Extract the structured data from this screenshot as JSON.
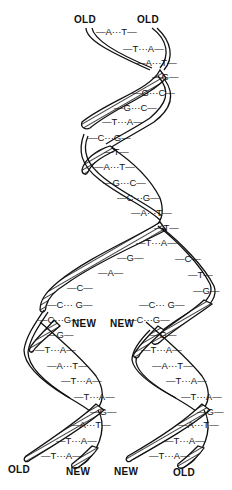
{
  "diagram": {
    "strand_labels": {
      "top_left": "OLD",
      "top_right": "OLD",
      "mid_left_new": "NEW",
      "mid_right_new": "NEW",
      "bottom_1": "OLD",
      "bottom_2": "NEW",
      "bottom_3": "NEW",
      "bottom_4": "OLD"
    },
    "parent_helix_pairs": [
      {
        "label": "A···T",
        "x": 96,
        "y": 27
      },
      {
        "label": "T···A",
        "x": 123,
        "y": 44
      },
      {
        "label": "A···T",
        "x": 136,
        "y": 58
      },
      {
        "label": "G",
        "x": 152,
        "y": 72
      },
      {
        "label": "G···C",
        "x": 132,
        "y": 88
      },
      {
        "label": "G···C",
        "x": 114,
        "y": 103
      },
      {
        "label": "T···A",
        "x": 102,
        "y": 117
      },
      {
        "label": "C···G",
        "x": 88,
        "y": 133
      },
      {
        "label": "T",
        "x": 104,
        "y": 147
      },
      {
        "label": "A···T",
        "x": 94,
        "y": 162
      },
      {
        "label": "G···C",
        "x": 103,
        "y": 178
      },
      {
        "label": "C···G",
        "x": 117,
        "y": 193
      },
      {
        "label": "A···T",
        "x": 131,
        "y": 208
      },
      {
        "label": "T",
        "x": 154,
        "y": 223
      },
      {
        "label": "T···A",
        "x": 136,
        "y": 238
      }
    ],
    "fork_unpaired_bases": [
      {
        "label": "G",
        "x": 117,
        "y": 253
      },
      {
        "label": "A",
        "x": 98,
        "y": 268
      },
      {
        "label": "C",
        "x": 67,
        "y": 283
      },
      {
        "label": "C",
        "x": 175,
        "y": 254
      },
      {
        "label": "T",
        "x": 188,
        "y": 270
      },
      {
        "label": "G",
        "x": 193,
        "y": 286
      }
    ],
    "fork_new_pairs": [
      {
        "label": "C··· G",
        "x": 47,
        "y": 300
      },
      {
        "label": "C··· G",
        "x": 139,
        "y": 300
      },
      {
        "label": "C···G",
        "x": 38,
        "y": 315
      },
      {
        "label": "C···G",
        "x": 127,
        "y": 315
      }
    ],
    "left_daughter_pairs": [
      {
        "label": "G",
        "x": 47,
        "y": 330
      },
      {
        "label": "T···A",
        "x": 35,
        "y": 345
      },
      {
        "label": "A···T",
        "x": 47,
        "y": 361
      },
      {
        "label": "T···A",
        "x": 61,
        "y": 376
      },
      {
        "label": "T···A",
        "x": 74,
        "y": 392
      },
      {
        "label": "G",
        "x": 90,
        "y": 407
      },
      {
        "label": "A···T",
        "x": 70,
        "y": 420
      },
      {
        "label": "T···A",
        "x": 56,
        "y": 436
      },
      {
        "label": "T···A",
        "x": 41,
        "y": 451
      }
    ],
    "right_daughter_pairs": [
      {
        "label": "G",
        "x": 150,
        "y": 330
      },
      {
        "label": "T···A",
        "x": 141,
        "y": 345
      },
      {
        "label": "A···T",
        "x": 152,
        "y": 361
      },
      {
        "label": "T···A",
        "x": 166,
        "y": 376
      },
      {
        "label": "T···A",
        "x": 181,
        "y": 392
      },
      {
        "label": "G",
        "x": 197,
        "y": 407
      },
      {
        "label": "A···T",
        "x": 178,
        "y": 420
      },
      {
        "label": "T···A",
        "x": 164,
        "y": 436
      },
      {
        "label": "T···A",
        "x": 149,
        "y": 451
      }
    ],
    "colors": {
      "ink": "#111111",
      "background": "#ffffff"
    }
  }
}
